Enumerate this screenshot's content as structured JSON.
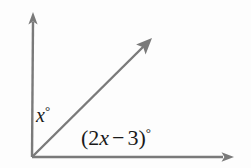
{
  "figure": {
    "type": "angle-diagram",
    "background_color": "#fdfdfd",
    "stroke_color": "#7a7a7a",
    "text_color": "#1a1a1a",
    "vertex": {
      "x": 32,
      "y": 157
    },
    "rays": [
      {
        "name": "vertical-ray",
        "from": {
          "x": 32,
          "y": 157
        },
        "to": {
          "x": 33,
          "y": 13
        },
        "arrowhead": "end",
        "direction": "up"
      },
      {
        "name": "diagonal-ray",
        "from": {
          "x": 32,
          "y": 157
        },
        "to": {
          "x": 152,
          "y": 38
        },
        "arrowhead": "end",
        "direction": "up-right"
      },
      {
        "name": "horizontal-ray",
        "from": {
          "x": 32,
          "y": 157
        },
        "to": {
          "x": 234,
          "y": 157
        },
        "arrowhead": "end",
        "direction": "right"
      }
    ],
    "labels": {
      "upper_angle": {
        "variable": "x",
        "degree_symbol": "°",
        "full_text": "x°",
        "position": {
          "x": 36,
          "y": 104
        }
      },
      "lower_angle": {
        "open_paren": "(",
        "coefficient": "2",
        "variable": "x",
        "operator": "−",
        "constant": "3",
        "close_paren": ")",
        "degree_symbol": "°",
        "full_text": "(2x − 3)°",
        "position": {
          "x": 81,
          "y": 126
        }
      }
    }
  }
}
